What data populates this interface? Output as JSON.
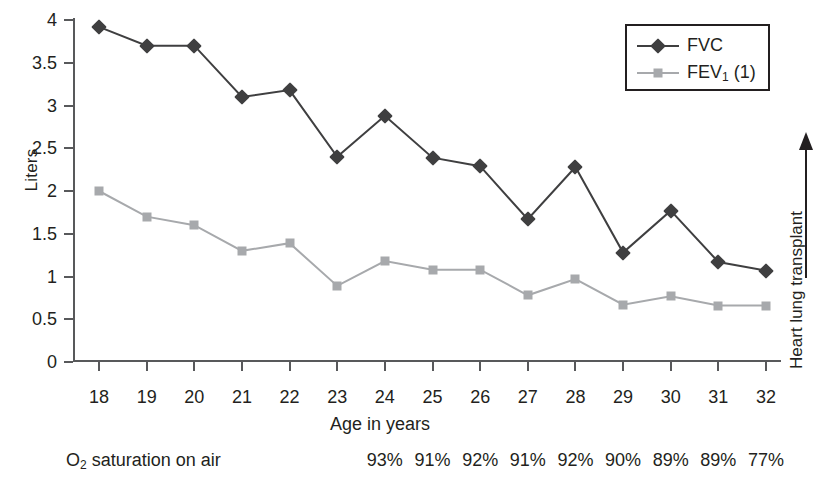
{
  "axes": {
    "y_title": "Liters",
    "x_title": "Age in years",
    "y_ticks": [
      "0",
      "0.5",
      "1",
      "1.5",
      "2",
      "2.5",
      "3",
      "3.5",
      "4"
    ],
    "x_ticks": [
      "18",
      "19",
      "20",
      "21",
      "22",
      "23",
      "24",
      "25",
      "26",
      "27",
      "28",
      "29",
      "30",
      "31",
      "32"
    ]
  },
  "legend": {
    "items": [
      {
        "label": "FVC",
        "marker": "diamond-marker",
        "color": "#3f3f40"
      },
      {
        "label_main": "FEV",
        "label_sub": "1",
        "label_tail": " (1)",
        "marker": "square-marker",
        "color": "#a7a9ac"
      }
    ]
  },
  "o2_row": {
    "label_main": "O",
    "label_sub": "2",
    "label_tail": " saturation on air",
    "values": [
      "93%",
      "91%",
      "92%",
      "91%",
      "92%",
      "90%",
      "89%",
      "89%",
      "77%"
    ],
    "ages": [
      24,
      25,
      26,
      27,
      28,
      29,
      30,
      31,
      32
    ]
  },
  "annotation": {
    "text": "Heart lung transplant"
  },
  "chart_data": {
    "type": "line",
    "title": "",
    "xlabel": "Age in years",
    "ylabel": "Liters",
    "xlim": [
      18,
      32
    ],
    "ylim": [
      0,
      4
    ],
    "ytick_step": 0.5,
    "grid": false,
    "legend_position": "top-right",
    "x": [
      18,
      19,
      20,
      21,
      22,
      23,
      24,
      25,
      26,
      27,
      28,
      29,
      30,
      31,
      32
    ],
    "categories": [
      "18",
      "19",
      "20",
      "21",
      "22",
      "23",
      "24",
      "25",
      "26",
      "27",
      "28",
      "29",
      "30",
      "31",
      "32"
    ],
    "series": [
      {
        "name": "FVC",
        "color": "#3f3f40",
        "marker": "diamond",
        "values": [
          3.92,
          3.7,
          3.7,
          3.1,
          3.18,
          2.4,
          2.88,
          2.39,
          2.29,
          1.67,
          2.28,
          1.28,
          1.77,
          1.17,
          1.07
        ]
      },
      {
        "name": "FEV1 (1)",
        "color": "#a7a9ac",
        "marker": "square",
        "values": [
          2.0,
          1.7,
          1.6,
          1.3,
          1.39,
          0.89,
          1.18,
          1.08,
          1.08,
          0.78,
          0.97,
          0.67,
          0.77,
          0.66,
          0.66
        ]
      }
    ],
    "annotations": [
      {
        "text": "Heart lung transplant",
        "position": "right-axis",
        "arrow": "up"
      },
      {
        "text": "O2 saturation on air",
        "position": "below-x-axis",
        "values": [
          "93%",
          "91%",
          "92%",
          "91%",
          "92%",
          "90%",
          "89%",
          "89%",
          "77%"
        ],
        "at_x": [
          24,
          25,
          26,
          27,
          28,
          29,
          30,
          31,
          32
        ]
      }
    ]
  }
}
